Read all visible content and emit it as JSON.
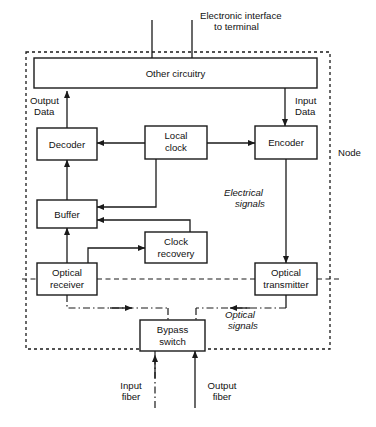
{
  "diagram": {
    "boundary_label": "Node",
    "blocks": {
      "other_circuitry": "Other circuitry",
      "decoder": "Decoder",
      "local_clock_l1": "Local",
      "local_clock_l2": "clock",
      "encoder": "Encoder",
      "buffer": "Buffer",
      "clock_recovery_l1": "Clock",
      "clock_recovery_l2": "recovery",
      "optical_receiver_l1": "Optical",
      "optical_receiver_l2": "receiver",
      "optical_transmitter_l1": "Optical",
      "optical_transmitter_l2": "transmitter",
      "bypass_switch_l1": "Bypass",
      "bypass_switch_l2": "switch"
    },
    "annotations": {
      "electronic_interface_l1": "Electronic interface",
      "electronic_interface_l2": "to terminal",
      "output_data_l1": "Output",
      "output_data_l2": "Data",
      "input_data_l1": "Input",
      "input_data_l2": "Data",
      "electrical_signals_l1": "Electrical",
      "electrical_signals_l2": "signals",
      "optical_signals_l1": "Optical",
      "optical_signals_l2": "signals",
      "input_fiber_l1": "Input",
      "input_fiber_l2": "fiber",
      "output_fiber_l1": "Output",
      "output_fiber_l2": "fiber"
    },
    "colors": {
      "line": "#1a1a1a",
      "background": "#ffffff",
      "block_fill": "#ffffff"
    }
  }
}
